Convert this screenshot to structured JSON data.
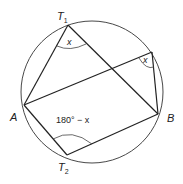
{
  "diagram": {
    "type": "cyclic-quadrilateral-angles",
    "circle": {
      "cx": 92,
      "cy": 92,
      "r": 71
    },
    "points": {
      "T1": {
        "x": 68,
        "y": 25,
        "label": "T",
        "sub": "1"
      },
      "C": {
        "x": 152,
        "y": 52
      },
      "A": {
        "x": 24,
        "y": 105,
        "label": "A"
      },
      "B": {
        "x": 158,
        "y": 114,
        "label": "B"
      },
      "T2": {
        "x": 67,
        "y": 155,
        "label": "T",
        "sub": "2"
      }
    },
    "angles": {
      "t1": "x",
      "c": "x",
      "t2": "180° − x"
    },
    "colors": {
      "stroke": "#222222",
      "background": "#ffffff"
    }
  }
}
